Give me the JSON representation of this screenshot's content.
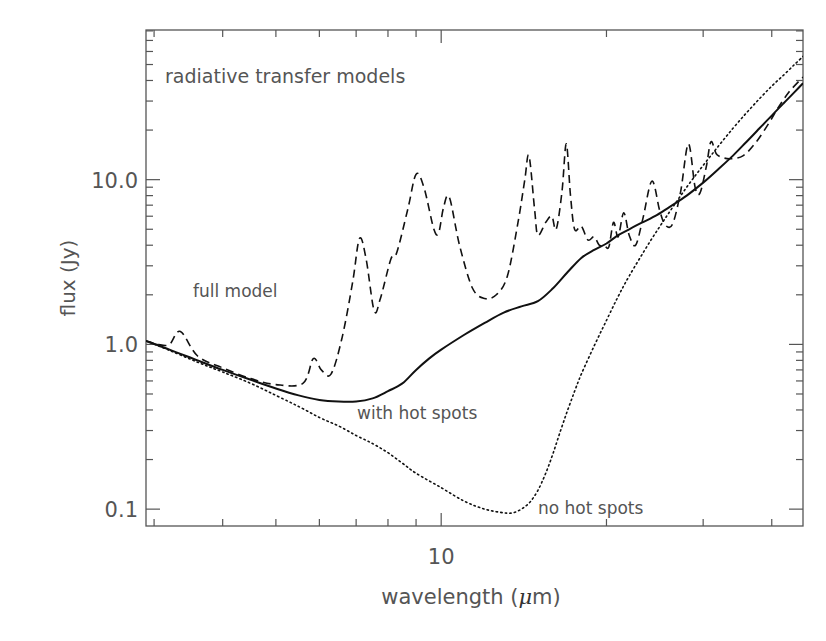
{
  "page_header": {
    "running_title": "",
    "page_number": "35"
  },
  "chart_data": {
    "type": "line",
    "title": "radiative transfer models",
    "xlabel": "wavelength (μm)",
    "xlabel_prefix": "wavelength (",
    "xlabel_unit": "μ",
    "xlabel_suffix": "m)",
    "ylabel": "flux (Jy)",
    "xscale": "log",
    "yscale": "log",
    "xlim": [
      2.9,
      45.6
    ],
    "ylim": [
      0.079,
      81
    ],
    "x_tick_labels": [
      {
        "value": 10,
        "label": "10"
      }
    ],
    "x_minor_ticks": [
      3,
      4,
      5,
      6,
      7,
      8,
      9,
      20,
      30,
      40
    ],
    "y_tick_labels": [
      {
        "value": 0.1,
        "label": "0.1"
      },
      {
        "value": 1,
        "label": "1.0"
      },
      {
        "value": 10,
        "label": "10.0"
      }
    ],
    "y_minor_ticks": [
      0.2,
      0.3,
      0.4,
      0.5,
      0.6,
      0.7,
      0.8,
      0.9,
      2,
      3,
      4,
      5,
      6,
      7,
      8,
      9,
      20,
      30,
      40,
      50,
      60,
      70,
      80
    ],
    "grid": false,
    "legend": "none (inline annotations)",
    "annotations": [
      {
        "text": "radiative transfer models",
        "x": 165,
        "y": 83,
        "size": 19
      },
      {
        "text": "full model",
        "x": 193,
        "y": 297,
        "size": 17
      },
      {
        "text": "with hot spots",
        "x": 357,
        "y": 419,
        "size": 17
      },
      {
        "text": "no hot spots",
        "x": 538,
        "y": 514,
        "size": 17
      }
    ],
    "series": [
      {
        "name": "full model",
        "style": "dashed",
        "points": [
          [
            2.9,
            1.05
          ],
          [
            3.05,
            1.0
          ],
          [
            3.2,
            1.0
          ],
          [
            3.35,
            1.2
          ],
          [
            3.6,
            0.85
          ],
          [
            4.0,
            0.72
          ],
          [
            4.5,
            0.62
          ],
          [
            5.0,
            0.57
          ],
          [
            5.6,
            0.58
          ],
          [
            5.85,
            0.82
          ],
          [
            6.05,
            0.7
          ],
          [
            6.3,
            0.66
          ],
          [
            6.6,
            1.1
          ],
          [
            6.9,
            2.4
          ],
          [
            7.1,
            4.4
          ],
          [
            7.3,
            3.3
          ],
          [
            7.55,
            1.6
          ],
          [
            7.75,
            1.9
          ],
          [
            8.1,
            3.3
          ],
          [
            8.3,
            3.6
          ],
          [
            8.7,
            6.7
          ],
          [
            9.0,
            10.8
          ],
          [
            9.3,
            9.0
          ],
          [
            9.7,
            5.0
          ],
          [
            9.9,
            4.8
          ],
          [
            10.1,
            6.8
          ],
          [
            10.35,
            7.8
          ],
          [
            10.8,
            4.0
          ],
          [
            11.4,
            2.2
          ],
          [
            12.0,
            1.9
          ],
          [
            12.6,
            2.0
          ],
          [
            13.2,
            2.6
          ],
          [
            13.8,
            5.5
          ],
          [
            14.2,
            10.0
          ],
          [
            14.45,
            14.0
          ],
          [
            14.8,
            6.5
          ],
          [
            15.0,
            4.6
          ],
          [
            15.5,
            5.5
          ],
          [
            15.9,
            6.0
          ],
          [
            16.2,
            5.0
          ],
          [
            16.6,
            8.5
          ],
          [
            16.9,
            16.5
          ],
          [
            17.2,
            8.0
          ],
          [
            17.5,
            5.0
          ],
          [
            18.0,
            5.2
          ],
          [
            18.5,
            4.3
          ],
          [
            19.0,
            4.5
          ],
          [
            19.4,
            4.0
          ],
          [
            19.8,
            4.0
          ],
          [
            20.2,
            3.9
          ],
          [
            20.6,
            5.5
          ],
          [
            21.0,
            4.5
          ],
          [
            21.5,
            6.3
          ],
          [
            22.0,
            4.6
          ],
          [
            22.6,
            4.0
          ],
          [
            23.3,
            5.8
          ],
          [
            24.2,
            9.8
          ],
          [
            25.0,
            6.5
          ],
          [
            25.6,
            5.3
          ],
          [
            26.4,
            5.4
          ],
          [
            27.3,
            8.5
          ],
          [
            28.2,
            16.5
          ],
          [
            29.0,
            9.0
          ],
          [
            29.6,
            8.3
          ],
          [
            30.4,
            12.0
          ],
          [
            31.0,
            17.0
          ],
          [
            31.8,
            14.2
          ],
          [
            33.5,
            13.4
          ],
          [
            35.5,
            14.0
          ],
          [
            37.5,
            17.0
          ],
          [
            39.5,
            22.0
          ],
          [
            41.0,
            27.0
          ],
          [
            43.0,
            34.0
          ],
          [
            45.6,
            42.0
          ]
        ]
      },
      {
        "name": "with hot spots",
        "style": "solid",
        "points": [
          [
            2.9,
            1.05
          ],
          [
            3.2,
            0.93
          ],
          [
            3.6,
            0.8
          ],
          [
            4.0,
            0.7
          ],
          [
            4.5,
            0.61
          ],
          [
            5.0,
            0.54
          ],
          [
            5.5,
            0.49
          ],
          [
            6.0,
            0.46
          ],
          [
            6.5,
            0.45
          ],
          [
            7.0,
            0.45
          ],
          [
            7.5,
            0.47
          ],
          [
            8.0,
            0.52
          ],
          [
            8.5,
            0.58
          ],
          [
            9.0,
            0.7
          ],
          [
            9.5,
            0.82
          ],
          [
            10.0,
            0.93
          ],
          [
            11.0,
            1.14
          ],
          [
            12.0,
            1.35
          ],
          [
            13.0,
            1.56
          ],
          [
            14.0,
            1.7
          ],
          [
            15.0,
            1.83
          ],
          [
            16.0,
            2.2
          ],
          [
            17.0,
            2.75
          ],
          [
            18.0,
            3.35
          ],
          [
            19.0,
            3.75
          ],
          [
            20.0,
            4.1
          ],
          [
            21.0,
            4.6
          ],
          [
            22.0,
            5.0
          ],
          [
            23.0,
            5.4
          ],
          [
            24.5,
            6.0
          ],
          [
            26.0,
            6.8
          ],
          [
            28.0,
            8.0
          ],
          [
            30.0,
            9.6
          ],
          [
            32.0,
            11.6
          ],
          [
            34.0,
            14.0
          ],
          [
            36.0,
            17.0
          ],
          [
            38.0,
            20.5
          ],
          [
            40.0,
            24.5
          ],
          [
            42.0,
            29.0
          ],
          [
            44.0,
            34.0
          ],
          [
            45.6,
            38.5
          ]
        ]
      },
      {
        "name": "no hot spots",
        "style": "dotted",
        "points": [
          [
            2.9,
            1.05
          ],
          [
            3.2,
            0.92
          ],
          [
            3.6,
            0.78
          ],
          [
            4.0,
            0.68
          ],
          [
            4.5,
            0.58
          ],
          [
            5.0,
            0.49
          ],
          [
            5.5,
            0.42
          ],
          [
            6.0,
            0.36
          ],
          [
            6.5,
            0.32
          ],
          [
            7.0,
            0.28
          ],
          [
            7.5,
            0.25
          ],
          [
            8.0,
            0.22
          ],
          [
            8.5,
            0.19
          ],
          [
            9.0,
            0.165
          ],
          [
            10.0,
            0.135
          ],
          [
            11.0,
            0.112
          ],
          [
            12.0,
            0.1
          ],
          [
            13.0,
            0.095
          ],
          [
            13.5,
            0.095
          ],
          [
            14.0,
            0.1
          ],
          [
            14.5,
            0.11
          ],
          [
            15.0,
            0.13
          ],
          [
            15.5,
            0.165
          ],
          [
            16.0,
            0.22
          ],
          [
            16.5,
            0.3
          ],
          [
            17.0,
            0.4
          ],
          [
            17.5,
            0.52
          ],
          [
            18.0,
            0.66
          ],
          [
            19.0,
            0.98
          ],
          [
            20.0,
            1.4
          ],
          [
            21.0,
            1.95
          ],
          [
            22.0,
            2.6
          ],
          [
            24.0,
            4.2
          ],
          [
            26.0,
            6.3
          ],
          [
            28.0,
            9.0
          ],
          [
            30.0,
            12.2
          ],
          [
            32.0,
            16.0
          ],
          [
            34.0,
            20.5
          ],
          [
            36.0,
            25.5
          ],
          [
            38.0,
            31.0
          ],
          [
            40.0,
            37.0
          ],
          [
            42.0,
            43.0
          ],
          [
            44.0,
            50.0
          ],
          [
            45.6,
            56.0
          ]
        ]
      }
    ]
  },
  "colors": {
    "axis": "#555555",
    "curve": "#111111",
    "text": "#555555"
  }
}
